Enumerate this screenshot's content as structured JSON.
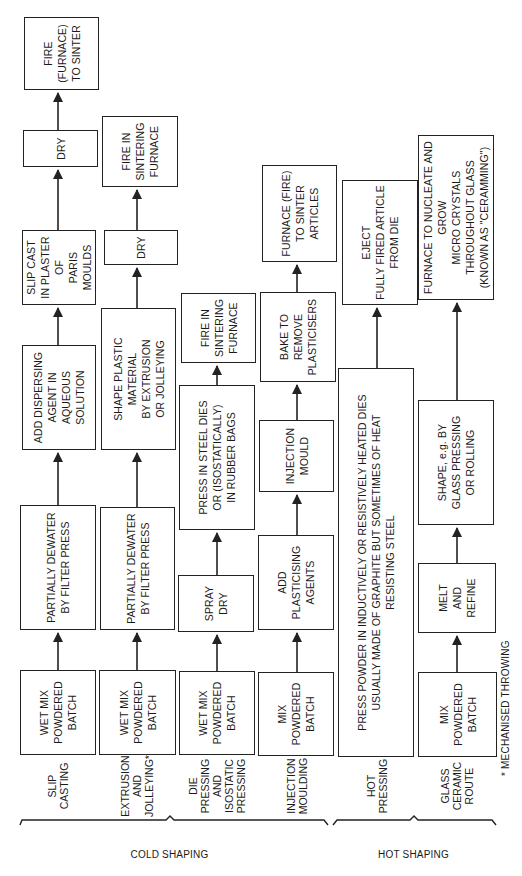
{
  "groups": [
    {
      "label": "COLD SHAPING"
    },
    {
      "label": "HOT SHAPING"
    }
  ],
  "rows": [
    {
      "label": "SLIP\nCASTING",
      "steps": [
        "WET MIX\nPOWDERED\nBATCH",
        "PARTIALLY DEWATER\nBY FILTER PRESS",
        "ADD DISPERSING\nAGENT IN\nAQUEOUS SOLUTION",
        "SLIP CAST\nIN PLASTER OF\nPARIS MOULDS",
        "DRY",
        "FIRE\n(FURNACE)\nTO SINTER"
      ]
    },
    {
      "label": "EXTRUSION\nAND\nJOLLEYING*",
      "steps": [
        "WET MIX\nPOWDERED\nBATCH",
        "PARTIALLY DEWATER\nBY FILTER PRESS",
        "SHAPE PLASTIC MATERIAL\nBY EXTRUSION\nOR JOLLEYING",
        "DRY",
        "FIRE IN\nSINTERING\nFURNACE"
      ]
    },
    {
      "label": "DIE\nPRESSING\nAND\nISOSTATIC\nPRESSING",
      "steps": [
        "WET MIX\nPOWDERED\nBATCH",
        "SPRAY\nDRY",
        "PRESS IN STEEL DIES\nOR (ISOSTATICALLY)\nIN RUBBER BAGS",
        "FIRE IN\nSINTERING\nFURNACE"
      ]
    },
    {
      "label": "INJECTION\nMOULDING",
      "steps": [
        "MIX\nPOWDERED\nBATCH",
        "ADD\nPLASTICISING\nAGENTS",
        "INJECTION\nMOULD",
        "BAKE TO\nREMOVE\nPLASTICISERS",
        "FURNACE (FIRE)\nTO SINTER\nARTICLES"
      ]
    },
    {
      "label": "HOT\nPRESSING",
      "steps": [
        "PRESS POWDER IN INDUCTIVELY OR RESISTIVELY HEATED DIES\nUSUALLY MADE OF GRAPHITE  BUT SOMETIMES OF HEAT\nRESISTING STEEL",
        "EJECT\nFULLY FIRED ARTICLE\nFROM DIE"
      ]
    },
    {
      "label": "GLASS\nCERAMIC\nROUTE",
      "steps": [
        "MIX\nPOWDERED\nBATCH",
        "MELT\nAND\nREFINE",
        "SHAPE, e.g. BY\nGLASS PRESSING\nOR ROLLING",
        "FURNACE TO NUCLEATE AND GROW\nMICRO CRYSTALS THROUGHOUT GLASS\n(KNOWN AS \"CERAMMING\")"
      ]
    }
  ],
  "footnote": "* MECHANISED THROWING",
  "colors": {
    "line": "#222222",
    "background": "#ffffff",
    "text": "#1a1a1a"
  }
}
